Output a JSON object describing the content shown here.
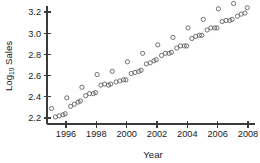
{
  "chart_data": {
    "type": "scatter",
    "title": "",
    "subtitle": "",
    "xlabel": "Year",
    "ylabel_parts": {
      "prefix": "Log",
      "subscript": "10",
      "suffix": " Sales"
    },
    "ylabel": "Log10 Sales",
    "xlim": [
      1994.8,
      2008.2
    ],
    "ylim": [
      2.16,
      3.3
    ],
    "xticks": [
      1996,
      1998,
      2000,
      2002,
      2004,
      2006,
      2008
    ],
    "xtick_labels": [
      "1996",
      "1998",
      "2000",
      "2002",
      "2004",
      "2006",
      "2008"
    ],
    "yticks": [
      2.2,
      2.4,
      2.6,
      2.8,
      3.0,
      3.2
    ],
    "ytick_labels": [
      "2.2",
      "2.4",
      "2.6",
      "2.8",
      "3.0",
      "3.2"
    ],
    "grid": false,
    "legend": false,
    "marker": "open-circle",
    "marker_color": "#5a5a5a",
    "axis_color": "#3b3b3b",
    "background": "#ffffff",
    "series": [
      {
        "name": "Log10 Sales",
        "points": [
          [
            1995.05,
            2.29
          ],
          [
            1995.3,
            2.21
          ],
          [
            1995.55,
            2.22
          ],
          [
            1995.8,
            2.23
          ],
          [
            1995.95,
            2.24
          ],
          [
            1996.05,
            2.39
          ],
          [
            1996.3,
            2.31
          ],
          [
            1996.55,
            2.33
          ],
          [
            1996.8,
            2.35
          ],
          [
            1996.95,
            2.36
          ],
          [
            1997.05,
            2.49
          ],
          [
            1997.3,
            2.41
          ],
          [
            1997.55,
            2.43
          ],
          [
            1997.8,
            2.43
          ],
          [
            1997.95,
            2.44
          ],
          [
            1998.05,
            2.61
          ],
          [
            1998.3,
            2.51
          ],
          [
            1998.55,
            2.52
          ],
          [
            1998.8,
            2.51
          ],
          [
            1998.95,
            2.52
          ],
          [
            1999.05,
            2.64
          ],
          [
            1999.3,
            2.54
          ],
          [
            1999.55,
            2.55
          ],
          [
            1999.8,
            2.56
          ],
          [
            1999.95,
            2.56
          ],
          [
            2000.05,
            2.73
          ],
          [
            2000.3,
            2.62
          ],
          [
            2000.55,
            2.63
          ],
          [
            2000.8,
            2.64
          ],
          [
            2000.95,
            2.65
          ],
          [
            2001.05,
            2.81
          ],
          [
            2001.3,
            2.71
          ],
          [
            2001.55,
            2.72
          ],
          [
            2001.8,
            2.74
          ],
          [
            2001.95,
            2.75
          ],
          [
            2002.05,
            2.89
          ],
          [
            2002.3,
            2.79
          ],
          [
            2002.55,
            2.81
          ],
          [
            2002.8,
            2.81
          ],
          [
            2002.95,
            2.82
          ],
          [
            2003.05,
            2.96
          ],
          [
            2003.3,
            2.86
          ],
          [
            2003.55,
            2.88
          ],
          [
            2003.8,
            2.88
          ],
          [
            2003.95,
            2.88
          ],
          [
            2004.05,
            3.05
          ],
          [
            2004.3,
            2.95
          ],
          [
            2004.55,
            2.97
          ],
          [
            2004.8,
            2.98
          ],
          [
            2004.95,
            2.98
          ],
          [
            2005.05,
            3.13
          ],
          [
            2005.3,
            3.03
          ],
          [
            2005.55,
            3.05
          ],
          [
            2005.8,
            3.05
          ],
          [
            2005.95,
            3.05
          ],
          [
            2006.05,
            3.23
          ],
          [
            2006.3,
            3.11
          ],
          [
            2006.55,
            3.12
          ],
          [
            2006.8,
            3.12
          ],
          [
            2006.95,
            3.13
          ],
          [
            2007.05,
            3.28
          ],
          [
            2007.3,
            3.16
          ],
          [
            2007.55,
            3.18
          ],
          [
            2007.8,
            3.19
          ],
          [
            2007.95,
            3.24
          ]
        ]
      }
    ]
  }
}
